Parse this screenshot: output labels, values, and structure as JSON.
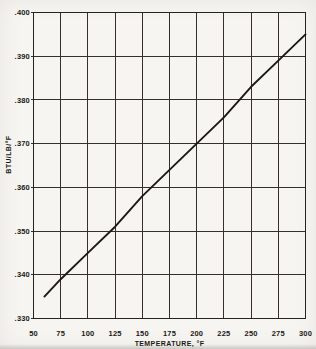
{
  "page": {
    "kind": "scanned technical chart",
    "background": "#f6f5f2"
  },
  "colors": {
    "background": "#f6f5f2",
    "grid": "#34302a",
    "border": "#26231e",
    "line": "#1c1915",
    "text": "#1c1915"
  },
  "chart_data": {
    "type": "line",
    "title": "",
    "xlabel": "TEMPERATURE, °F",
    "ylabel": "BTU/LB/°F",
    "xlim": [
      50,
      300
    ],
    "ylim": [
      0.33,
      0.4
    ],
    "x_ticks": [
      50,
      75,
      100,
      125,
      150,
      175,
      200,
      225,
      250,
      275,
      300
    ],
    "x_tick_labels": [
      "50",
      "75",
      "100",
      "125",
      "150",
      "175",
      "200",
      "225",
      "250",
      "275",
      "300"
    ],
    "y_ticks": [
      0.33,
      0.34,
      0.35,
      0.36,
      0.37,
      0.38,
      0.39,
      0.4
    ],
    "y_tick_labels": [
      ".330",
      ".340",
      ".350",
      ".360",
      ".370",
      ".380",
      ".390",
      ".400"
    ],
    "grid": "major-both",
    "legend": "none",
    "series": [
      {
        "name": "specific-heat-vs-temperature",
        "x": [
          60,
          75,
          100,
          125,
          150,
          175,
          200,
          225,
          250,
          275,
          300
        ],
        "y": [
          0.335,
          0.339,
          0.345,
          0.351,
          0.358,
          0.364,
          0.37,
          0.376,
          0.383,
          0.389,
          0.395
        ]
      }
    ]
  }
}
